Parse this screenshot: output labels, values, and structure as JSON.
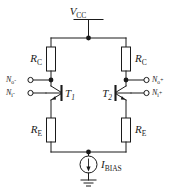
{
  "figure": {
    "background": "#ffffff",
    "line_color": "#1a1a1a"
  },
  "supply": {
    "label": "V",
    "subscript": "CC",
    "name": "vcc-rail"
  },
  "resistors": {
    "collector_left": {
      "label": "R",
      "subscript": "C"
    },
    "collector_right": {
      "label": "R",
      "subscript": "C"
    },
    "emitter_left": {
      "label": "R",
      "subscript": "E"
    },
    "emitter_right": {
      "label": "R",
      "subscript": "E"
    }
  },
  "transistors": {
    "left": {
      "label": "T",
      "subscript": "1",
      "type": "npn"
    },
    "right": {
      "label": "T",
      "subscript": "2",
      "type": "npn"
    }
  },
  "current_source": {
    "label": "I",
    "subscript": "BIAS",
    "direction": "down"
  },
  "terminals": {
    "output_left": {
      "label": "N",
      "subscript": "o",
      "polarity": "-"
    },
    "input_left": {
      "label": "N",
      "subscript": "i",
      "polarity": "-"
    },
    "output_right": {
      "label": "N",
      "subscript": "o",
      "polarity": "+"
    },
    "input_right": {
      "label": "N",
      "subscript": "i",
      "polarity": "+"
    }
  },
  "ground": {
    "name": "ground-symbol"
  }
}
